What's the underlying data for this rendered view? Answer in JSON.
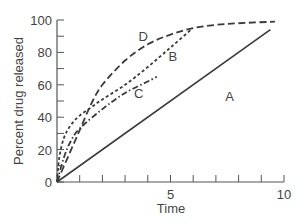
{
  "chart_data": {
    "type": "line",
    "title": "",
    "xlabel": "Time",
    "ylabel": "Percent drug released",
    "xlim": [
      0,
      10
    ],
    "ylim": [
      0,
      100
    ],
    "grid": false,
    "legend": "inline curve labels",
    "x_ticks": [
      0,
      1,
      2,
      3,
      4,
      5,
      6,
      7,
      8,
      9,
      10
    ],
    "x_tick_labels": [
      "",
      "",
      "",
      "",
      "",
      "5",
      "",
      "",
      "",
      "",
      "10"
    ],
    "y_ticks": [
      0,
      10,
      20,
      30,
      40,
      50,
      60,
      70,
      80,
      90,
      100
    ],
    "y_tick_labels": [
      "0",
      "",
      "20",
      "",
      "40",
      "",
      "60",
      "",
      "80",
      "",
      "100"
    ],
    "series": [
      {
        "name": "A",
        "style": "solid",
        "points": [
          [
            0,
            0
          ],
          [
            9.4,
            94
          ]
        ],
        "label_pos": [
          7.6,
          53
        ]
      },
      {
        "name": "B",
        "style": "short-dash",
        "points": [
          [
            0,
            0
          ],
          [
            0.1,
            15
          ],
          [
            0.3,
            27
          ],
          [
            0.6,
            35
          ],
          [
            1,
            41
          ],
          [
            1.5,
            46
          ],
          [
            2,
            51
          ],
          [
            3,
            60
          ],
          [
            4,
            71
          ],
          [
            5,
            83
          ],
          [
            5.9,
            94
          ]
        ],
        "label_pos": [
          5.1,
          78
        ]
      },
      {
        "name": "C",
        "style": "dash-dot",
        "points": [
          [
            0,
            0
          ],
          [
            0.3,
            15
          ],
          [
            0.6,
            25
          ],
          [
            1,
            33
          ],
          [
            2,
            45
          ],
          [
            3,
            55
          ],
          [
            4,
            62
          ],
          [
            4.4,
            65
          ]
        ],
        "label_pos": [
          3.6,
          55
        ]
      },
      {
        "name": "D",
        "style": "long-dash",
        "points": [
          [
            0,
            0
          ],
          [
            0.5,
            16
          ],
          [
            1,
            32
          ],
          [
            1.5,
            48
          ],
          [
            2,
            60
          ],
          [
            3,
            75
          ],
          [
            4,
            85
          ],
          [
            5,
            91
          ],
          [
            6,
            95
          ],
          [
            7,
            97
          ],
          [
            8,
            98
          ],
          [
            9.6,
            99
          ]
        ],
        "label_pos": [
          3.8,
          90
        ]
      }
    ]
  }
}
